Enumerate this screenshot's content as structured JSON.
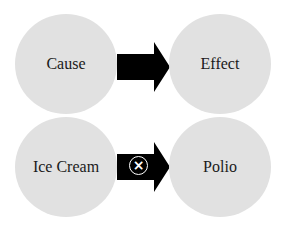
{
  "diagram": {
    "rows": [
      {
        "left": {
          "label": "Cause"
        },
        "right": {
          "label": "Effect"
        },
        "connector": {
          "type": "arrow",
          "icon": "none"
        }
      },
      {
        "left": {
          "label": "Ice Cream"
        },
        "right": {
          "label": "Polio"
        },
        "connector": {
          "type": "arrow",
          "icon": "circled-x-icon",
          "glyph": "×"
        }
      }
    ],
    "colors": {
      "circle_fill": "#e1e1e1",
      "arrow": "#000000",
      "background": "#ffffff"
    }
  }
}
